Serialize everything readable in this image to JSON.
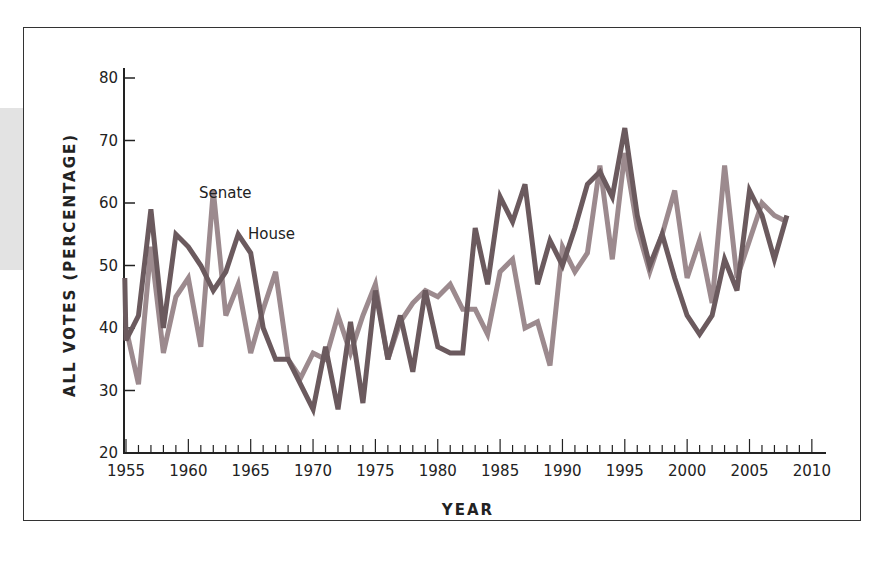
{
  "chart_data": {
    "type": "line",
    "title": "",
    "xlabel": "YEAR",
    "ylabel": "ALL VOTES (PERCENTAGE)",
    "xlim": [
      1955,
      2011
    ],
    "ylim": [
      20,
      80
    ],
    "x_ticks": [
      1955,
      1960,
      1965,
      1970,
      1975,
      1980,
      1985,
      1990,
      1995,
      2000,
      2005,
      2010
    ],
    "y_ticks": [
      20,
      30,
      40,
      50,
      60,
      70,
      80
    ],
    "grid": false,
    "legend": "inline labels",
    "series": [
      {
        "name": "House",
        "color": "#6b5a5e",
        "x": [
          1955,
          1956,
          1957,
          1958,
          1959,
          1960,
          1961,
          1962,
          1963,
          1964,
          1965,
          1966,
          1967,
          1968,
          1969,
          1970,
          1971,
          1972,
          1973,
          1974,
          1975,
          1976,
          1977,
          1978,
          1979,
          1980,
          1981,
          1982,
          1983,
          1984,
          1985,
          1986,
          1987,
          1988,
          1989,
          1990,
          1991,
          1992,
          1993,
          1994,
          1995,
          1996,
          1997,
          1998,
          1999,
          2000,
          2001,
          2002,
          2003,
          2004,
          2005,
          2006,
          2007,
          2008
        ],
        "values": [
          38,
          42,
          59,
          40,
          55,
          53,
          50,
          46,
          49,
          55,
          52,
          40,
          35,
          35,
          31,
          27,
          37,
          27,
          41,
          28,
          46,
          35,
          42,
          33,
          46,
          37,
          36,
          36,
          56,
          47,
          61,
          57,
          63,
          47,
          54,
          50,
          56,
          63,
          65,
          61,
          72,
          58,
          50,
          55,
          48,
          42,
          39,
          42,
          51,
          46,
          62,
          58,
          51,
          58
        ]
      },
      {
        "name": "Senate",
        "color": "#9c8a8e",
        "x": [
          1955,
          1956,
          1957,
          1958,
          1959,
          1960,
          1961,
          1962,
          1963,
          1964,
          1965,
          1966,
          1967,
          1968,
          1969,
          1970,
          1971,
          1972,
          1973,
          1974,
          1975,
          1976,
          1977,
          1978,
          1979,
          1980,
          1981,
          1982,
          1983,
          1984,
          1985,
          1986,
          1987,
          1988,
          1989,
          1990,
          1991,
          1992,
          1993,
          1994,
          1995,
          1996,
          1997,
          1998,
          1999,
          2000,
          2001,
          2002,
          2003,
          2004,
          2005,
          2006,
          2007,
          2008
        ],
        "values": [
          40,
          31,
          53,
          36,
          45,
          48,
          37,
          62,
          42,
          47,
          36,
          43,
          49,
          35,
          32,
          36,
          35,
          42,
          36,
          42,
          47,
          35,
          41,
          44,
          46,
          45,
          47,
          43,
          43,
          39,
          49,
          51,
          40,
          41,
          34,
          53,
          49,
          52,
          66,
          51,
          68,
          56,
          49,
          55,
          62,
          48,
          54,
          44,
          66,
          48,
          54,
          60,
          58,
          57
        ]
      }
    ],
    "annotations": [
      {
        "text": "Senate",
        "x": 1961.5,
        "y": 63
      },
      {
        "text": "House",
        "x": 1964.7,
        "y": 56.5
      }
    ]
  },
  "labels": {
    "xlabel": "YEAR",
    "ylabel": "ALL VOTES (PERCENTAGE)",
    "senate": "Senate",
    "house": "House"
  }
}
